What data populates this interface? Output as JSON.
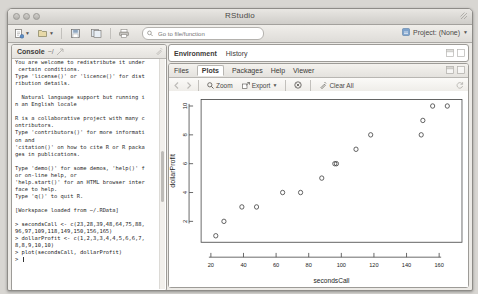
{
  "window": {
    "title": "RStudio",
    "traffic_lights": [
      "close",
      "minimize",
      "zoom"
    ]
  },
  "toolbar": {
    "new_file_label": "new-file",
    "open_label": "open-file",
    "save_label": "save",
    "save_all_label": "save-all",
    "print_label": "print",
    "search": {
      "placeholder": "Go to file/function",
      "value": ""
    },
    "project_label": "Project: (None)"
  },
  "console": {
    "title": "Console",
    "path": "~/",
    "clear_icon": "broom-icon",
    "text": "You are welcome to redistribute it under\n certain conditions.\nType 'license()' or 'licence()' for dist\nribution details.\n\n  Natural language support but running i\nn an English locale\n\nR is a collaborative project with many c\nontributors.\nType 'contributors()' for more informati\non and\n'citation()' on how to cite R or R packa\nges in publications.\n\nType 'demo()' for some demos, 'help()' f\nor on-line help, or\n'help.start()' for an HTML browser inter\nface to help.\nType 'q()' to quit R.\n\n[Workspace loaded from ~/.RData]\n\n",
    "cmd1": "> secondsCall <- c(23,28,39,48,64,75,88,\n96,97,109,118,149,150,156,165)",
    "cmd2": "> dollarProfit <- c(1,2,3,3,4,4,5,6,6,7,\n8,8,9,10,10)",
    "cmd3": "> plot(secondsCall, dollarProfit)",
    "prompt": "> "
  },
  "env_panel": {
    "tabs": [
      {
        "label": "Environment",
        "active": true
      },
      {
        "label": "History",
        "active": false
      }
    ],
    "minimize_icon": "minimize-icon",
    "maximize_icon": "maximize-icon"
  },
  "plot_panel": {
    "tabs": [
      {
        "label": "Files",
        "active": false
      },
      {
        "label": "Plots",
        "active": true
      },
      {
        "label": "Packages",
        "active": false
      },
      {
        "label": "Help",
        "active": false
      },
      {
        "label": "Viewer",
        "active": false
      }
    ],
    "minimize_icon": "minimize-icon",
    "maximize_icon": "maximize-icon",
    "toolbar": {
      "back_icon": "left-arrow-icon",
      "forward_icon": "right-arrow-icon",
      "zoom_label": "Zoom",
      "zoom_icon": "magnifier-icon",
      "export_label": "Export",
      "export_icon": "export-icon",
      "remove_icon": "remove-plot-icon",
      "clear_all_label": "Clear All",
      "clear_all_icon": "broom-icon",
      "refresh_icon": "refresh-icon"
    }
  },
  "chart_data": {
    "type": "scatter",
    "title": "",
    "xlabel": "secondsCall",
    "ylabel": "dollarProfit",
    "x": [
      23,
      28,
      39,
      48,
      64,
      75,
      88,
      96,
      97,
      109,
      118,
      149,
      150,
      156,
      165
    ],
    "y": [
      1,
      2,
      3,
      3,
      4,
      4,
      5,
      6,
      6,
      7,
      8,
      8,
      9,
      10,
      10
    ],
    "xticks": [
      20,
      40,
      60,
      80,
      100,
      120,
      140,
      160
    ],
    "yticks": [
      2,
      4,
      6,
      8,
      10
    ],
    "xlim": [
      14,
      174
    ],
    "ylim": [
      0.55,
      10.45
    ],
    "grid": false,
    "legend": null,
    "marker": "open-circle",
    "marker_color": "#444444"
  }
}
